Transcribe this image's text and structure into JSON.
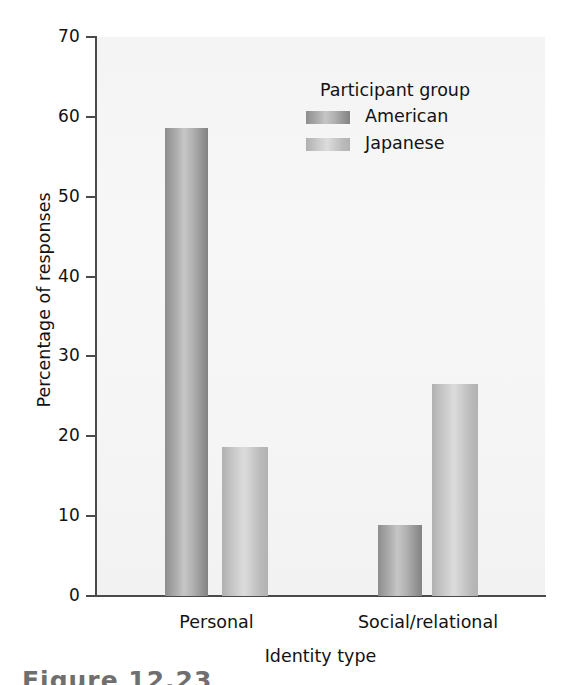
{
  "chart_data": {
    "type": "bar",
    "title": "",
    "xlabel": "Identity type",
    "ylabel": "Percentage of responses",
    "categories": [
      "Personal",
      "Social/relational"
    ],
    "series": [
      {
        "name": "American",
        "values": [
          58.6,
          8.9
        ],
        "color": "#a8a8a8"
      },
      {
        "name": "Japanese",
        "values": [
          18.6,
          26.5
        ],
        "color": "#c8c8c8"
      }
    ],
    "ylim": [
      0,
      70
    ],
    "yticks": [
      0,
      10,
      20,
      30,
      40,
      50,
      60,
      70
    ],
    "ytick_labels": [
      "0",
      "10",
      "20",
      "30",
      "40",
      "50",
      "60",
      "70"
    ],
    "grid": false,
    "legend_position": "upper-right-inside",
    "legend_title": "Participant group"
  },
  "axes": {
    "y_title": "Percentage of responses",
    "x_title": "Identity type",
    "y_ticks": [
      "70",
      "60",
      "50",
      "40",
      "30",
      "20",
      "10",
      "0"
    ],
    "x_categories": [
      "Personal",
      "Social/relational"
    ]
  },
  "legend": {
    "title": "Participant group",
    "entries": [
      {
        "label": "American",
        "swatch": "american-swatch"
      },
      {
        "label": "Japanese",
        "swatch": "japanese-swatch"
      }
    ]
  },
  "caption": {
    "text": "Figure 12.23"
  },
  "colors": {
    "plot_background": "#f5f5f5",
    "axis": "#4a4a4a",
    "text": "#121212",
    "american_bar": "#a8a8a8",
    "japanese_bar": "#cacaca"
  }
}
